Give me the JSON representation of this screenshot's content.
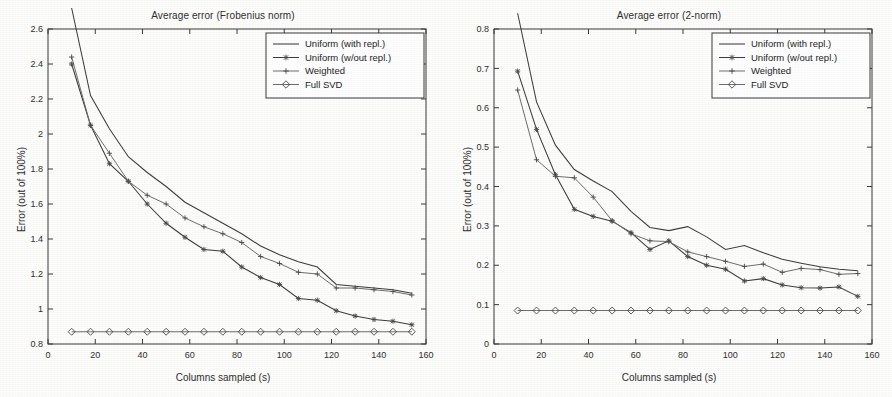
{
  "figure": {
    "background_color": "#fdfdfc",
    "line_color": "#3d3d3d",
    "axis_color": "#3a3a3a"
  },
  "panels": [
    {
      "id": "frobenius",
      "title": "Average error (Frobenius norm)",
      "xlabel": "Columns sampled (s)",
      "ylabel": "Error (out of 100%)"
    },
    {
      "id": "twonorm",
      "title": "Average error (2-norm)",
      "xlabel": "Columns sampled (s)",
      "ylabel": "Error (out of 100%)"
    }
  ],
  "legend": {
    "entries": [
      {
        "label": "Uniform (with repl.)",
        "marker": "none"
      },
      {
        "label": "Uniform (w/out repl.)",
        "marker": "asterisk"
      },
      {
        "label": "Weighted",
        "marker": "plus"
      },
      {
        "label": "Full SVD",
        "marker": "diamond"
      }
    ]
  },
  "chart_data": [
    {
      "type": "line",
      "title": "Average error (Frobenius norm)",
      "xlabel": "Columns sampled (s)",
      "ylabel": "Error (out of 100%)",
      "xlim": [
        0,
        160
      ],
      "ylim": [
        0.8,
        2.6
      ],
      "xticks": [
        0,
        20,
        40,
        60,
        80,
        100,
        120,
        140,
        160
      ],
      "yticks": [
        0.8,
        1.0,
        1.2,
        1.4,
        1.6,
        1.8,
        2.0,
        2.2,
        2.4,
        2.6
      ],
      "grid": false,
      "legend_position": "top-right",
      "x": [
        10,
        18,
        26,
        34,
        42,
        50,
        58,
        66,
        74,
        82,
        90,
        98,
        106,
        114,
        122,
        130,
        138,
        146,
        154
      ],
      "series": [
        {
          "name": "Uniform (with repl.)",
          "marker": "none",
          "values": [
            2.72,
            2.22,
            2.03,
            1.87,
            1.78,
            1.7,
            1.61,
            1.55,
            1.49,
            1.43,
            1.36,
            1.31,
            1.27,
            1.24,
            1.14,
            1.13,
            1.12,
            1.11,
            1.09
          ]
        },
        {
          "name": "Uniform (w/out repl.)",
          "marker": "asterisk",
          "values": [
            2.4,
            2.05,
            1.83,
            1.73,
            1.6,
            1.49,
            1.41,
            1.34,
            1.33,
            1.24,
            1.18,
            1.14,
            1.06,
            1.05,
            0.99,
            0.96,
            0.94,
            0.93,
            0.91
          ]
        },
        {
          "name": "Weighted",
          "marker": "plus",
          "values": [
            2.44,
            2.05,
            1.89,
            1.73,
            1.65,
            1.6,
            1.52,
            1.47,
            1.43,
            1.38,
            1.3,
            1.26,
            1.21,
            1.2,
            1.12,
            1.12,
            1.11,
            1.1,
            1.08
          ]
        },
        {
          "name": "Full SVD",
          "marker": "diamond",
          "values": [
            0.87,
            0.87,
            0.87,
            0.87,
            0.87,
            0.87,
            0.87,
            0.87,
            0.87,
            0.87,
            0.87,
            0.87,
            0.87,
            0.87,
            0.87,
            0.87,
            0.87,
            0.87,
            0.87
          ]
        }
      ]
    },
    {
      "type": "line",
      "title": "Average error (2-norm)",
      "xlabel": "Columns sampled (s)",
      "ylabel": "Error (out of 100%)",
      "xlim": [
        0,
        160
      ],
      "ylim": [
        0,
        0.8
      ],
      "xticks": [
        0,
        20,
        40,
        60,
        80,
        100,
        120,
        140,
        160
      ],
      "yticks": [
        0,
        0.1,
        0.2,
        0.3,
        0.4,
        0.5,
        0.6,
        0.7,
        0.8
      ],
      "grid": false,
      "legend_position": "top-right",
      "x": [
        10,
        18,
        26,
        34,
        42,
        50,
        58,
        66,
        74,
        82,
        90,
        98,
        106,
        114,
        122,
        130,
        138,
        146,
        154
      ],
      "series": [
        {
          "name": "Uniform (with repl.)",
          "marker": "none",
          "values": [
            0.84,
            0.615,
            0.505,
            0.443,
            0.414,
            0.387,
            0.337,
            0.296,
            0.288,
            0.298,
            0.272,
            0.24,
            0.25,
            0.232,
            0.215,
            0.205,
            0.196,
            0.19,
            0.186
          ]
        },
        {
          "name": "Uniform (w/out repl.)",
          "marker": "asterisk",
          "values": [
            0.693,
            0.545,
            0.43,
            0.342,
            0.324,
            0.312,
            0.283,
            0.24,
            0.262,
            0.222,
            0.2,
            0.19,
            0.16,
            0.166,
            0.15,
            0.143,
            0.142,
            0.145,
            0.121
          ]
        },
        {
          "name": "Weighted",
          "marker": "plus",
          "values": [
            0.645,
            0.468,
            0.426,
            0.422,
            0.373,
            0.313,
            0.28,
            0.262,
            0.26,
            0.234,
            0.222,
            0.21,
            0.197,
            0.203,
            0.182,
            0.192,
            0.189,
            0.177,
            0.179
          ]
        },
        {
          "name": "Full SVD",
          "marker": "diamond",
          "values": [
            0.085,
            0.085,
            0.085,
            0.085,
            0.085,
            0.085,
            0.085,
            0.085,
            0.085,
            0.085,
            0.085,
            0.085,
            0.085,
            0.085,
            0.085,
            0.085,
            0.085,
            0.085,
            0.085
          ]
        }
      ]
    }
  ]
}
